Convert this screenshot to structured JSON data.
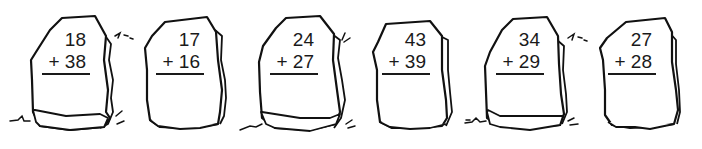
{
  "worksheet": {
    "problems": [
      {
        "top": "18",
        "bottom": "+ 38",
        "addend1": 18,
        "addend2": 38,
        "operator": "+"
      },
      {
        "top": "17",
        "bottom": "+ 16",
        "addend1": 17,
        "addend2": 16,
        "operator": "+"
      },
      {
        "top": "24",
        "bottom": "+ 27",
        "addend1": 24,
        "addend2": 27,
        "operator": "+"
      },
      {
        "top": "43",
        "bottom": "+ 39",
        "addend1": 43,
        "addend2": 39,
        "operator": "+"
      },
      {
        "top": "34",
        "bottom": "+ 29",
        "addend1": 34,
        "addend2": 29,
        "operator": "+"
      },
      {
        "top": "27",
        "bottom": "+ 28",
        "addend1": 27,
        "addend2": 28,
        "operator": "+"
      }
    ],
    "icons": [
      "rock-icon",
      "grass-icon"
    ],
    "colors": {
      "ink": "#111111",
      "background": "#ffffff"
    }
  }
}
